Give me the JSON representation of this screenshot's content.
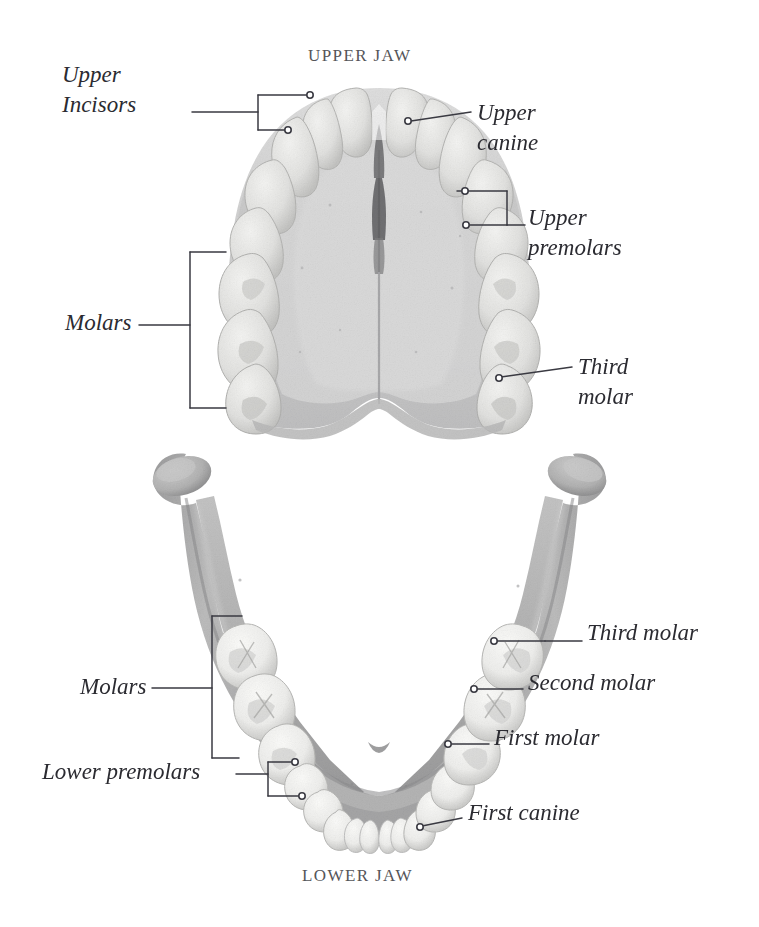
{
  "figure": {
    "kind": "anatomical-illustration",
    "titles": {
      "upper": "UPPER JAW",
      "lower": "LOWER JAW"
    }
  },
  "upper_jaw": {
    "labels": {
      "upper_incisors_line1": "Upper",
      "upper_incisors_line2": "Incisors",
      "upper_canine_line1": "Upper",
      "upper_canine_line2": "canine",
      "upper_premolars_line1": "Upper",
      "upper_premolars_line2": "premolars",
      "molars": "Molars",
      "third_molar_line1": "Third",
      "third_molar_line2": "molar"
    }
  },
  "lower_jaw": {
    "labels": {
      "molars": "Molars",
      "lower_premolars": "Lower premolars",
      "third_molar": "Third molar",
      "second_molar": "Second molar",
      "first_molar": "First molar",
      "first_canine": "First canine"
    }
  },
  "colors": {
    "background": "#ffffff",
    "title_text": "#555559",
    "label_text": "#2b2b31",
    "leader_line": "#3a3a42",
    "palate_bone": "#cfcfcf",
    "palate_bone_dark": "#b9b9bb",
    "upper_tooth": "#e8e8e6",
    "upper_tooth_shadow": "#c6c6c4",
    "mandible_bone": "#b0b0b0",
    "mandible_bone_dark": "#8f8f90",
    "lower_tooth": "#f2f2f0",
    "lower_tooth_shadow": "#bdbdbb",
    "suture": "#6e6e70"
  }
}
